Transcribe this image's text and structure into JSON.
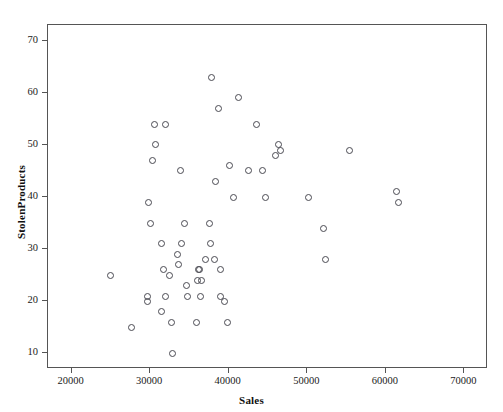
{
  "chart_data": {
    "type": "scatter",
    "title": "",
    "xlabel": "Sales",
    "ylabel": "StolenProducts",
    "xlim": [
      17000,
      73000
    ],
    "ylim": [
      7,
      73
    ],
    "grid": false,
    "legend": "none",
    "marker": "open-circle",
    "marker_color": "#4a4a52",
    "xticks": [
      20000,
      30000,
      40000,
      50000,
      60000,
      70000
    ],
    "xtick_labels": [
      "20000",
      "30000",
      "40000",
      "50000",
      "60000",
      "70000"
    ],
    "yticks": [
      10,
      20,
      30,
      40,
      50,
      60,
      70
    ],
    "ytick_labels": [
      "10",
      "20",
      "30",
      "40",
      "50",
      "60",
      "70"
    ],
    "n_points": 52,
    "x": [
      25000,
      27600,
      29700,
      29700,
      30100,
      30500,
      30600,
      31000,
      31100,
      31400,
      31500,
      31700,
      32000,
      32100,
      32400,
      32500,
      32700,
      32800,
      33000,
      33200,
      33500,
      33600,
      34100,
      34400,
      34600,
      34900,
      35000,
      35400,
      35700,
      36000,
      36200,
      36400,
      36600,
      36900,
      37100,
      37400,
      37500,
      37600,
      38000,
      38300,
      38900,
      39500,
      40300,
      40600,
      42500,
      44300,
      44900,
      46000,
      46600,
      47000,
      50100,
      52300,
      52900,
      55400,
      61300,
      61600,
      62000
    ],
    "y": [
      25,
      15,
      21,
      20,
      35,
      54,
      39,
      54,
      47,
      18,
      31,
      50,
      21,
      26,
      45,
      25,
      16,
      10,
      35,
      31,
      29,
      27,
      63,
      26,
      23,
      35,
      27,
      59,
      57,
      24,
      26,
      21,
      31,
      35,
      28,
      54,
      26,
      16,
      46,
      43,
      21,
      20,
      40,
      40,
      45,
      45,
      40,
      48,
      49,
      34,
      28,
      41,
      39
    ],
    "points": [
      {
        "x": 25000,
        "y": 25
      },
      {
        "x": 27600,
        "y": 15
      },
      {
        "x": 29700,
        "y": 21
      },
      {
        "x": 29700,
        "y": 20
      },
      {
        "x": 30100,
        "y": 35
      },
      {
        "x": 30500,
        "y": 54
      },
      {
        "x": 29800,
        "y": 39
      },
      {
        "x": 31900,
        "y": 54
      },
      {
        "x": 30300,
        "y": 47
      },
      {
        "x": 31400,
        "y": 18
      },
      {
        "x": 31500,
        "y": 31
      },
      {
        "x": 30700,
        "y": 50
      },
      {
        "x": 32000,
        "y": 21
      },
      {
        "x": 31700,
        "y": 26
      },
      {
        "x": 33900,
        "y": 45
      },
      {
        "x": 32500,
        "y": 25
      },
      {
        "x": 32700,
        "y": 16
      },
      {
        "x": 32800,
        "y": 10
      },
      {
        "x": 34400,
        "y": 35
      },
      {
        "x": 34000,
        "y": 31
      },
      {
        "x": 33500,
        "y": 29
      },
      {
        "x": 33600,
        "y": 27
      },
      {
        "x": 37800,
        "y": 63
      },
      {
        "x": 36300,
        "y": 26
      },
      {
        "x": 34600,
        "y": 23
      },
      {
        "x": 37500,
        "y": 35
      },
      {
        "x": 36500,
        "y": 24
      },
      {
        "x": 41200,
        "y": 59
      },
      {
        "x": 38700,
        "y": 57
      },
      {
        "x": 36000,
        "y": 24
      },
      {
        "x": 36200,
        "y": 26
      },
      {
        "x": 36400,
        "y": 21
      },
      {
        "x": 37700,
        "y": 31
      },
      {
        "x": 38200,
        "y": 28
      },
      {
        "x": 37100,
        "y": 28
      },
      {
        "x": 43500,
        "y": 54
      },
      {
        "x": 38900,
        "y": 26
      },
      {
        "x": 39800,
        "y": 16
      },
      {
        "x": 40100,
        "y": 46
      },
      {
        "x": 38300,
        "y": 43
      },
      {
        "x": 38900,
        "y": 21
      },
      {
        "x": 39500,
        "y": 20
      },
      {
        "x": 44700,
        "y": 40
      },
      {
        "x": 40600,
        "y": 40
      },
      {
        "x": 42500,
        "y": 45
      },
      {
        "x": 44300,
        "y": 45
      },
      {
        "x": 46300,
        "y": 50
      },
      {
        "x": 46000,
        "y": 48
      },
      {
        "x": 46600,
        "y": 49
      },
      {
        "x": 52000,
        "y": 34
      },
      {
        "x": 50100,
        "y": 40
      },
      {
        "x": 52300,
        "y": 28
      },
      {
        "x": 61300,
        "y": 41
      },
      {
        "x": 55400,
        "y": 49
      },
      {
        "x": 61600,
        "y": 39
      },
      {
        "x": 34700,
        "y": 21
      },
      {
        "x": 35900,
        "y": 16
      }
    ]
  },
  "axes": {
    "x_title": "Sales",
    "y_title": "StolenProducts",
    "x_tick_labels": [
      "20000",
      "30000",
      "40000",
      "50000",
      "60000",
      "70000"
    ],
    "y_tick_labels": [
      "70",
      "60",
      "50",
      "40",
      "30",
      "20",
      "10"
    ]
  }
}
